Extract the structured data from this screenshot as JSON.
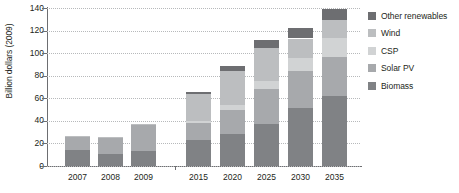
{
  "chart_data": {
    "type": "bar",
    "stacked": true,
    "title": "",
    "xlabel": "",
    "ylabel": "Billion dollars (2009)",
    "ylim": [
      0,
      140
    ],
    "yticks": [
      0,
      20,
      40,
      60,
      80,
      100,
      120,
      140
    ],
    "grid": true,
    "legend_position": "right",
    "categories": [
      "2007",
      "2008",
      "2009",
      "2015",
      "2020",
      "2025",
      "2030",
      "2035"
    ],
    "series": [
      {
        "name": "Biomass",
        "color": "#808285",
        "values": [
          14,
          11,
          13,
          23,
          28,
          37,
          51,
          62
        ]
      },
      {
        "name": "Solar PV",
        "color": "#a7a9ac",
        "values": [
          12,
          14,
          23,
          15,
          22,
          31,
          33,
          35
        ]
      },
      {
        "name": "CSP",
        "color": "#d1d3d4",
        "values": [
          0,
          0,
          0,
          2,
          4,
          7,
          12,
          16
        ]
      },
      {
        "name": "Wind",
        "color": "#bcbec0",
        "values": [
          1,
          1,
          1,
          24,
          30,
          30,
          17,
          16
        ]
      },
      {
        "name": "Other renewables",
        "color": "#6d6e71",
        "values": [
          0,
          0,
          0,
          2,
          5,
          7,
          9,
          10
        ]
      }
    ],
    "totals": [
      27,
      26,
      37,
      66,
      89,
      112,
      122,
      139
    ],
    "legend_order": [
      "Other renewables",
      "Wind",
      "CSP",
      "Solar PV",
      "Biomass"
    ]
  },
  "legend": {
    "items": [
      {
        "label": "Other renewables",
        "color": "#6d6e71"
      },
      {
        "label": "Wind",
        "color": "#bcbec0"
      },
      {
        "label": "CSP",
        "color": "#d1d3d4"
      },
      {
        "label": "Solar PV",
        "color": "#a7a9ac"
      },
      {
        "label": "Biomass",
        "color": "#808285"
      }
    ]
  }
}
